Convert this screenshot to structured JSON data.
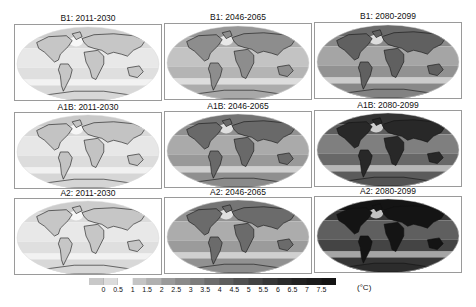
{
  "figure": {
    "panels": [
      {
        "title": "B1: 2011-2030",
        "scenario": "B1",
        "period": "2011-2030",
        "intensity": 0.12
      },
      {
        "title": "B1: 2046-2065",
        "scenario": "B1",
        "period": "2046-2065",
        "intensity": 0.32
      },
      {
        "title": "B1: 2080-2099",
        "scenario": "B1",
        "period": "2080-2099",
        "intensity": 0.48
      },
      {
        "title": "A1B: 2011-2030",
        "scenario": "A1B",
        "period": "2011-2030",
        "intensity": 0.13
      },
      {
        "title": "A1B: 2046-2065",
        "scenario": "A1B",
        "period": "2046-2065",
        "intensity": 0.45
      },
      {
        "title": "A1B: 2080-2099",
        "scenario": "A1B",
        "period": "2080-2099",
        "intensity": 0.68
      },
      {
        "title": "A2: 2011-2030",
        "scenario": "A2",
        "period": "2011-2030",
        "intensity": 0.12
      },
      {
        "title": "A2: 2046-2065",
        "scenario": "A2",
        "period": "2046-2065",
        "intensity": 0.44
      },
      {
        "title": "A2: 2080-2099",
        "scenario": "A2",
        "period": "2080-2099",
        "intensity": 0.85
      }
    ],
    "colorbar": {
      "ticks": [
        "0",
        "0.5",
        "1",
        "1.5",
        "2",
        "2.5",
        "3",
        "3.5",
        "4",
        "4.5",
        "5",
        "5.5",
        "6",
        "6.5",
        "7",
        "7.5"
      ],
      "unit": "(°C)",
      "colors": [
        "#c8c8c8",
        "#dcdcdc",
        "#ffffff",
        "#c4c4c4",
        "#b0b0b0",
        "#9a9a9a",
        "#8a8a8a",
        "#7c7c7c",
        "#6c6c6c",
        "#5e5e5e",
        "#505050",
        "#434343",
        "#363636",
        "#2b2b2b",
        "#222222",
        "#1b1b1b",
        "#141414"
      ]
    }
  }
}
